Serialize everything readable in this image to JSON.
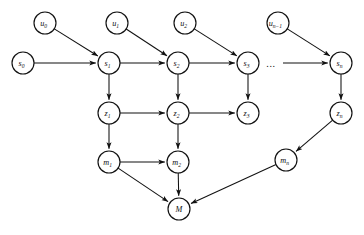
{
  "diagram": {
    "canvas": {
      "width": 364,
      "height": 235,
      "background": "#ffffff"
    },
    "style": {
      "node_radius": 11,
      "node_fill": "#ffffff",
      "node_stroke": "#111111",
      "edge_stroke": "#111111"
    },
    "ellipsis": {
      "label": "...",
      "x": 271,
      "y": 63
    },
    "nodes": [
      {
        "id": "u0",
        "base": "u",
        "sub": "0",
        "label": "u0",
        "x": 45,
        "y": 23,
        "row": "control"
      },
      {
        "id": "u1",
        "base": "u",
        "sub": "1",
        "label": "u1",
        "x": 117,
        "y": 23,
        "row": "control"
      },
      {
        "id": "u2",
        "base": "u",
        "sub": "2",
        "label": "u2",
        "x": 185,
        "y": 23,
        "row": "control"
      },
      {
        "id": "un1",
        "base": "u",
        "sub": "n−1",
        "label": "un−1",
        "x": 278,
        "y": 23,
        "row": "control"
      },
      {
        "id": "s0",
        "base": "s",
        "sub": "0",
        "label": "s0",
        "x": 23,
        "y": 63,
        "row": "state"
      },
      {
        "id": "s1",
        "base": "s",
        "sub": "1",
        "label": "s1",
        "x": 109,
        "y": 63,
        "row": "state"
      },
      {
        "id": "s2",
        "base": "s",
        "sub": "2",
        "label": "s2",
        "x": 178,
        "y": 63,
        "row": "state"
      },
      {
        "id": "s3",
        "base": "s",
        "sub": "3",
        "label": "s3",
        "x": 248,
        "y": 63,
        "row": "state"
      },
      {
        "id": "sn",
        "base": "s",
        "sub": "n",
        "label": "sn",
        "x": 341,
        "y": 63,
        "row": "state"
      },
      {
        "id": "z1",
        "base": "z",
        "sub": "1",
        "label": "z1",
        "x": 109,
        "y": 113,
        "row": "observation"
      },
      {
        "id": "z2",
        "base": "z",
        "sub": "2",
        "label": "z2",
        "x": 178,
        "y": 113,
        "row": "observation"
      },
      {
        "id": "z3",
        "base": "z",
        "sub": "3",
        "label": "z3",
        "x": 248,
        "y": 113,
        "row": "observation"
      },
      {
        "id": "zn",
        "base": "z",
        "sub": "n",
        "label": "zn",
        "x": 341,
        "y": 113,
        "row": "observation"
      },
      {
        "id": "m1",
        "base": "m",
        "sub": "1",
        "label": "m1",
        "x": 109,
        "y": 162,
        "row": "memory"
      },
      {
        "id": "m2",
        "base": "m",
        "sub": "2",
        "label": "m2",
        "x": 178,
        "y": 162,
        "row": "memory"
      },
      {
        "id": "mn",
        "base": "m",
        "sub": "n",
        "label": "mn",
        "x": 286,
        "y": 160,
        "row": "memory"
      },
      {
        "id": "M",
        "base": "M",
        "sub": "",
        "label": "M",
        "x": 179,
        "y": 209,
        "row": "map"
      }
    ],
    "edges": [
      {
        "from": "u0",
        "to": "s1",
        "arrow": true
      },
      {
        "from": "u1",
        "to": "s2",
        "arrow": true
      },
      {
        "from": "u2",
        "to": "s3",
        "arrow": true
      },
      {
        "from": "un1",
        "to": "sn",
        "arrow": true
      },
      {
        "from": "s0",
        "to": "s1",
        "arrow": true
      },
      {
        "from": "s1",
        "to": "s2",
        "arrow": true
      },
      {
        "from": "s2",
        "to": "s3",
        "arrow": true
      },
      {
        "from": "s1",
        "to": "z1",
        "arrow": true
      },
      {
        "from": "s2",
        "to": "z2",
        "arrow": true
      },
      {
        "from": "s3",
        "to": "z3",
        "arrow": true
      },
      {
        "from": "sn",
        "to": "zn",
        "arrow": true
      },
      {
        "from": "z1",
        "to": "z2",
        "arrow": true
      },
      {
        "from": "z2",
        "to": "z3",
        "arrow": true
      },
      {
        "from": "z1",
        "to": "m1",
        "arrow": true
      },
      {
        "from": "z2",
        "to": "m2",
        "arrow": true
      },
      {
        "from": "zn",
        "to": "mn",
        "arrow": true
      },
      {
        "from": "m1",
        "to": "m2",
        "arrow": true
      },
      {
        "from": "m1",
        "to": "M",
        "arrow": true
      },
      {
        "from": "m2",
        "to": "M",
        "arrow": true
      },
      {
        "from": "mn",
        "to": "M",
        "arrow": true
      }
    ],
    "dashed_segment": {
      "from_x": 283,
      "to_x": 330,
      "y": 63,
      "arrow": true
    }
  }
}
